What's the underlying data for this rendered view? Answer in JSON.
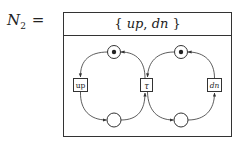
{
  "title": {
    "symbol": "N",
    "subscript": "2",
    "equals": "="
  },
  "header": {
    "open_brace": "{",
    "label_1": "up",
    "separator": ",",
    "label_2": "dn",
    "close_brace": "}"
  },
  "net": {
    "places": [
      {
        "id": "p-top-left",
        "marked": true
      },
      {
        "id": "p-bottom-left",
        "marked": false
      },
      {
        "id": "p-top-right",
        "marked": true
      },
      {
        "id": "p-bottom-right",
        "marked": false
      }
    ],
    "transitions": [
      {
        "id": "t-up",
        "label": "up"
      },
      {
        "id": "t-tau",
        "label": "τ"
      },
      {
        "id": "t-dn",
        "label": "dn"
      }
    ],
    "arcs": [
      {
        "from": "p-top-left",
        "to": "t-up"
      },
      {
        "from": "t-up",
        "to": "p-bottom-left"
      },
      {
        "from": "p-bottom-left",
        "to": "t-tau"
      },
      {
        "from": "t-tau",
        "to": "p-top-left"
      },
      {
        "from": "p-top-right",
        "to": "t-tau"
      },
      {
        "from": "t-tau",
        "to": "p-bottom-right"
      },
      {
        "from": "p-bottom-right",
        "to": "t-dn"
      },
      {
        "from": "t-dn",
        "to": "p-top-right"
      }
    ]
  },
  "colors": {
    "stroke": "#333333",
    "background": "#ffffff"
  }
}
